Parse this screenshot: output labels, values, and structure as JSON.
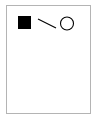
{
  "canvas": {
    "width": 98,
    "height": 120,
    "background_color": "#ffffff"
  },
  "page": {
    "frame_color": "#b4b4b4",
    "fill_color": "#ffffff",
    "x": 6,
    "y": 5,
    "width": 85,
    "height": 109
  },
  "diagram": {
    "title": "",
    "shapes": [
      {
        "name": "filled-square",
        "type": "square",
        "fill": "#000000",
        "stroke": "#000000",
        "stroke_width": 1,
        "x": 18,
        "y": 16,
        "width": 12,
        "height": 12
      },
      {
        "name": "connector-line",
        "type": "line",
        "fill": "none",
        "stroke": "#000000",
        "stroke_width": 1,
        "x1": 38,
        "y1": 19,
        "x2": 56,
        "y2": 28
      },
      {
        "name": "hollow-circle",
        "type": "circle",
        "fill": "none",
        "stroke": "#000000",
        "stroke_width": 1,
        "cx": 67,
        "cy": 23.5,
        "r": 6.5
      }
    ]
  }
}
